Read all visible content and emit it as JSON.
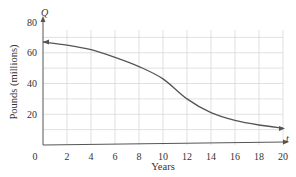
{
  "chart_data": {
    "type": "line",
    "title": "",
    "xlabel": "Years",
    "ylabel": "Pounds (millions)",
    "x_var": "t",
    "y_var": "Q",
    "xlim": [
      0,
      20
    ],
    "ylim": [
      0,
      80
    ],
    "x_ticks": [
      "0",
      "2",
      "4",
      "6",
      "8",
      "10",
      "12",
      "14",
      "16",
      "18",
      "20"
    ],
    "y_ticks": [
      "20",
      "40",
      "60",
      "80"
    ],
    "grid": true,
    "grid_x_step": 2,
    "grid_y_step": 10,
    "series": [
      {
        "name": "Q(t)",
        "x": [
          0,
          2,
          4,
          6,
          8,
          10,
          12,
          14,
          16,
          18,
          20
        ],
        "y": [
          67,
          65,
          62,
          57,
          51,
          43,
          30,
          21,
          16,
          13,
          11
        ]
      }
    ],
    "colors": {
      "curve": "#555555",
      "grid": "#d8d8d8",
      "axis": "#555555"
    }
  }
}
